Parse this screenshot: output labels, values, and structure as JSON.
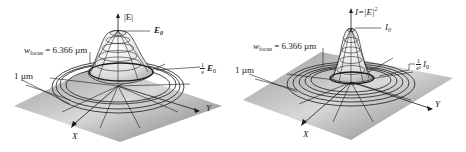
{
  "panels": [
    {
      "id": "field",
      "axis_z_label": "|E|",
      "peak_label": "E",
      "peak_sub": "0",
      "waist_label_prefix": "w",
      "waist_label_sub": "focus",
      "waist_value": "= 6.366 µm",
      "scale_label": "1 µm",
      "fraction_num": "1",
      "fraction_den": "e",
      "fraction_symbol": "E",
      "fraction_sub": "0",
      "axis_x_label": "X",
      "axis_y_label": "Y"
    },
    {
      "id": "intensity",
      "axis_z_label": "I=|E|",
      "axis_z_sup": "2",
      "peak_label": "I",
      "peak_sub": "0",
      "waist_label_prefix": "w",
      "waist_label_sub": "focus",
      "waist_value": "= 6.366 µm",
      "scale_label": "1 µm",
      "fraction_num": "1",
      "fraction_den": "e²",
      "fraction_symbol": "I",
      "fraction_sub": "0",
      "axis_x_label": "X",
      "axis_y_label": "Y"
    }
  ],
  "colors": {
    "plane_light": "#e6e6e6",
    "plane_dark": "#8c8c8c",
    "mesh": "#1a1a1a",
    "surface": "#f2f2f2"
  }
}
